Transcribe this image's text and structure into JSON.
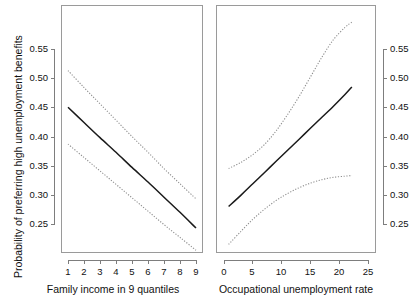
{
  "chart_data": [
    {
      "type": "line",
      "panel": "left",
      "title": "",
      "xlabel": "Family income in 9 quantiles",
      "ylabel": "Probability of preferring high unemployment benefits",
      "xlim": [
        0.4,
        9.6
      ],
      "ylim": [
        0.195,
        0.585
      ],
      "xticks": [
        1,
        2,
        3,
        4,
        5,
        6,
        7,
        8,
        9
      ],
      "xticklabels": [
        "1",
        "2",
        "3",
        "4",
        "5",
        "6",
        "7",
        "8",
        "9"
      ],
      "yticks": [
        0.25,
        0.3,
        0.35,
        0.4,
        0.45,
        0.5,
        0.55
      ],
      "yticklabels": [
        "0.25",
        "0.30",
        "0.35",
        "0.40",
        "0.45",
        "0.50",
        "0.55"
      ],
      "grid": false,
      "legend": "none",
      "x": [
        1,
        2,
        3,
        4,
        5,
        6,
        7,
        8,
        9
      ],
      "series": [
        {
          "name": "Predicted probability",
          "style": "solid",
          "color": "#1a1a1a",
          "values": [
            0.45,
            0.424,
            0.398,
            0.373,
            0.347,
            0.322,
            0.296,
            0.27,
            0.243
          ]
        },
        {
          "name": "Upper 95% confidence bound",
          "style": "dotted",
          "color": "#8e8e8e",
          "values": [
            0.513,
            0.484,
            0.456,
            0.428,
            0.4,
            0.373,
            0.345,
            0.319,
            0.293
          ]
        },
        {
          "name": "Lower 95% confidence bound",
          "style": "dotted",
          "color": "#8e8e8e",
          "values": [
            0.387,
            0.364,
            0.341,
            0.318,
            0.295,
            0.272,
            0.249,
            0.227,
            0.205
          ]
        }
      ]
    },
    {
      "type": "line",
      "panel": "right",
      "title": "",
      "xlabel": "Occupational unemployment rate",
      "ylabel": "Probability of preferring high unemployment benefits",
      "xlim": [
        -1.4,
        26.5
      ],
      "ylim": [
        0.195,
        0.585
      ],
      "xticks": [
        0,
        5,
        10,
        15,
        20,
        25
      ],
      "xticklabels": [
        "0",
        "5",
        "10",
        "15",
        "20",
        "25"
      ],
      "yticks": [
        0.25,
        0.3,
        0.35,
        0.4,
        0.45,
        0.5,
        0.55
      ],
      "yticklabels": [
        "0.25",
        "0.30",
        "0.35",
        "0.40",
        "0.45",
        "0.50",
        "0.55"
      ],
      "grid": false,
      "legend": "none",
      "x": [
        0.8,
        3,
        5,
        7,
        9,
        11,
        13,
        15,
        17,
        19,
        21,
        22.2
      ],
      "series": [
        {
          "name": "Predicted probability",
          "style": "solid",
          "color": "#1a1a1a",
          "values": [
            0.28,
            0.3,
            0.319,
            0.338,
            0.357,
            0.376,
            0.395,
            0.414,
            0.433,
            0.452,
            0.472,
            0.485
          ]
        },
        {
          "name": "Upper 95% confidence bound",
          "style": "dotted",
          "color": "#8e8e8e",
          "values": [
            0.345,
            0.356,
            0.369,
            0.386,
            0.409,
            0.437,
            0.468,
            0.502,
            0.536,
            0.566,
            0.587,
            0.596
          ]
        },
        {
          "name": "Lower 95% confidence bound",
          "style": "dotted",
          "color": "#8e8e8e",
          "values": [
            0.215,
            0.238,
            0.258,
            0.275,
            0.29,
            0.302,
            0.312,
            0.32,
            0.326,
            0.33,
            0.332,
            0.333
          ]
        }
      ]
    }
  ],
  "figure": {
    "ylabel": "Probability of preferring high unemployment benefits",
    "left_panel": {
      "xlabel": "Family income in 9 quantiles",
      "xticklabels": [
        "1",
        "2",
        "3",
        "4",
        "5",
        "6",
        "7",
        "8",
        "9"
      ],
      "yticklabels": [
        "0.55",
        "0.50",
        "0.45",
        "0.40",
        "0.35",
        "0.30",
        "0.25"
      ]
    },
    "right_panel": {
      "xlabel": "Occupational unemployment rate",
      "xticklabels": [
        "0",
        "5",
        "10",
        "15",
        "20",
        "25"
      ],
      "yticklabels": [
        "0.55",
        "0.50",
        "0.45",
        "0.40",
        "0.35",
        "0.30",
        "0.25"
      ]
    }
  }
}
